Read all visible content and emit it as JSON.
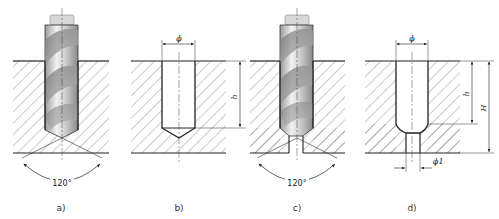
{
  "figure": {
    "panels": [
      {
        "id": "a",
        "caption": "a)",
        "content": "drill drilling blind hole",
        "angle_label": "120°"
      },
      {
        "id": "b",
        "caption": "b)",
        "content": "blind hole",
        "diameter_label": "ϕ",
        "depth_label": "h"
      },
      {
        "id": "c",
        "caption": "c)",
        "content": "drill enlarging stepped hole",
        "angle_label": "120°"
      },
      {
        "id": "d",
        "caption": "d)",
        "content": "stepped hole",
        "diameter_label": "ϕ",
        "small_diameter_label": "ϕ1",
        "depth_label": "h",
        "total_depth_label": "H"
      }
    ],
    "colors": {
      "line": "#222222",
      "hatch": "#555555",
      "drill_light": "#e8e8e8",
      "drill_dark": "#8a8a8a",
      "background": "#ffffff"
    }
  }
}
